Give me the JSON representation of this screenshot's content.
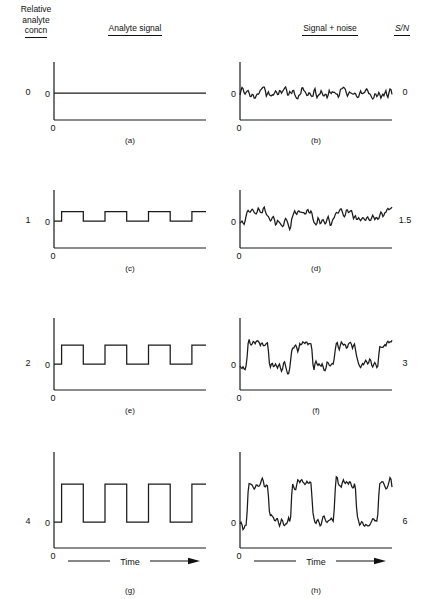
{
  "figure": {
    "headers": {
      "concentration": "Relative\nanalyte\nconcn",
      "concentration_line1": "Relative",
      "concentration_line2": "analyte",
      "concentration_line3": "concn",
      "analyte_signal": "Analyte signal",
      "signal_plus_noise": "Signal + noise",
      "sn_ratio": "S/N"
    },
    "axis_labels": {
      "zero": "0",
      "time": "Time"
    },
    "colors": {
      "trace": "#1a1a1a",
      "axis": "#1a1a1a",
      "background": "#ffffff"
    }
  },
  "rows": [
    {
      "concentration": "0",
      "sn": "0",
      "signal_caption": "(a)",
      "noise_caption": "(b)",
      "signal_amplitude": 0,
      "noise_amplitude": 1
    },
    {
      "concentration": "1",
      "sn": "1.5",
      "signal_caption": "(c)",
      "noise_caption": "(d)",
      "signal_amplitude": 1,
      "noise_amplitude": 1
    },
    {
      "concentration": "2",
      "sn": "3",
      "signal_caption": "(e)",
      "noise_caption": "(f)",
      "signal_amplitude": 2,
      "noise_amplitude": 1
    },
    {
      "concentration": "4",
      "sn": "6",
      "signal_caption": "(g)",
      "noise_caption": "(h)",
      "signal_amplitude": 4,
      "noise_amplitude": 1
    }
  ],
  "chart_data": {
    "type": "line",
    "xlabel": "Time",
    "ylabel": "",
    "grid": false,
    "legend": "none",
    "panels": [
      {
        "id": "a",
        "series": "analyte signal",
        "relative_concn": 0,
        "sn": 0,
        "waveform": "square",
        "cycles": 3.5,
        "amplitude": 0,
        "baseline": 0
      },
      {
        "id": "b",
        "series": "signal + noise",
        "relative_concn": 0,
        "sn": 0,
        "waveform": "square+noise",
        "cycles": 3.5,
        "amplitude": 0,
        "noise_rms": 1
      },
      {
        "id": "c",
        "series": "analyte signal",
        "relative_concn": 1,
        "sn": 1.5,
        "waveform": "square",
        "cycles": 3.5,
        "amplitude": 1,
        "baseline": 0
      },
      {
        "id": "d",
        "series": "signal + noise",
        "relative_concn": 1,
        "sn": 1.5,
        "waveform": "square+noise",
        "cycles": 3.5,
        "amplitude": 1,
        "noise_rms": 1
      },
      {
        "id": "e",
        "series": "analyte signal",
        "relative_concn": 2,
        "sn": 3,
        "waveform": "square",
        "cycles": 3.5,
        "amplitude": 2,
        "baseline": 0
      },
      {
        "id": "f",
        "series": "signal + noise",
        "relative_concn": 2,
        "sn": 3,
        "waveform": "square+noise",
        "cycles": 3.5,
        "amplitude": 2,
        "noise_rms": 1
      },
      {
        "id": "g",
        "series": "analyte signal",
        "relative_concn": 4,
        "sn": 6,
        "waveform": "square",
        "cycles": 3.5,
        "amplitude": 4,
        "baseline": 0
      },
      {
        "id": "h",
        "series": "signal + noise",
        "relative_concn": 4,
        "sn": 6,
        "waveform": "square+noise",
        "cycles": 3.5,
        "amplitude": 4,
        "noise_rms": 1
      }
    ],
    "categories": [
      "0",
      "1",
      "2",
      "4"
    ],
    "values": [
      0,
      1.5,
      3,
      6
    ],
    "x": [
      0,
      1,
      2,
      4
    ]
  }
}
